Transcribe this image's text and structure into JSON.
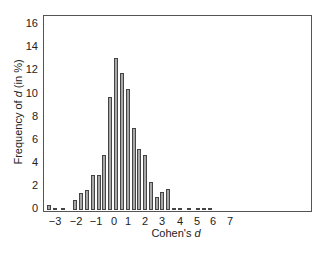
{
  "chart_data": {
    "type": "bar",
    "title": "",
    "xlabel": "Cohen's d",
    "ylabel": "Frequency of d (in %)",
    "ylim": [
      0,
      16.5
    ],
    "xlim": [
      -3.6,
      10.4
    ],
    "grid": false,
    "legend": null,
    "yticks": [
      0,
      2,
      4,
      6,
      8,
      10,
      12,
      14,
      16
    ],
    "xticks": [
      -3,
      -2,
      -1,
      0,
      1,
      2,
      3,
      4,
      5,
      6,
      7
    ],
    "bin_width": 0.25,
    "categories": [
      -3.5,
      -3.25,
      -2.75,
      -2.0,
      -1.75,
      -1.5,
      -1.0,
      -0.75,
      -0.5,
      -0.25,
      0.0,
      0.25,
      0.5,
      0.75,
      1.0,
      1.25,
      1.5,
      1.75,
      2.0,
      2.25,
      2.5,
      3.0,
      3.5,
      4.0,
      4.25,
      4.75
    ],
    "values": [
      0.4,
      0.15,
      0.15,
      0.9,
      1.45,
      1.7,
      3.0,
      3.0,
      4.8,
      9.75,
      13.15,
      11.85,
      10.5,
      7.1,
      5.3,
      4.75,
      2.4,
      1.1,
      1.6,
      1.85,
      0.2,
      0.2,
      0.2,
      0.2,
      0.2,
      0.2
    ],
    "bars_px": [
      {
        "x": 47,
        "h": 0.4
      },
      {
        "x": 53,
        "h": 0.15
      },
      {
        "x": 61,
        "h": 0.15
      },
      {
        "x": 73,
        "h": 0.9
      },
      {
        "x": 79,
        "h": 1.45
      },
      {
        "x": 85,
        "h": 1.7
      },
      {
        "x": 91,
        "h": 3.0
      },
      {
        "x": 97,
        "h": 3.0
      },
      {
        "x": 102,
        "h": 4.8
      },
      {
        "x": 108,
        "h": 9.75
      },
      {
        "x": 114,
        "h": 13.15
      },
      {
        "x": 120,
        "h": 11.85
      },
      {
        "x": 126,
        "h": 10.5
      },
      {
        "x": 132,
        "h": 7.1
      },
      {
        "x": 137,
        "h": 5.3
      },
      {
        "x": 143,
        "h": 4.75
      },
      {
        "x": 149,
        "h": 2.4
      },
      {
        "x": 155,
        "h": 1.1
      },
      {
        "x": 160,
        "h": 1.6
      },
      {
        "x": 166,
        "h": 1.85
      },
      {
        "x": 172,
        "h": 0.2
      },
      {
        "x": 178,
        "h": 0.2
      },
      {
        "x": 187,
        "h": 0.2
      },
      {
        "x": 196,
        "h": 0.2
      },
      {
        "x": 202,
        "h": 0.2
      },
      {
        "x": 208,
        "h": 0.2
      }
    ]
  },
  "axes": {
    "ylabel_prefix": "Frequency of ",
    "ylabel_var": "d",
    "ylabel_suffix": " (in %)",
    "xlabel_prefix": "Cohen's ",
    "xlabel_var": "d",
    "ytick_labels": [
      "0",
      "2",
      "4",
      "6",
      "8",
      "10",
      "12",
      "14",
      "16"
    ],
    "xtick_labels": [
      "−3",
      "−2",
      "−1",
      "0",
      "1",
      "2",
      "3",
      "4",
      "5",
      "6",
      "7"
    ]
  }
}
